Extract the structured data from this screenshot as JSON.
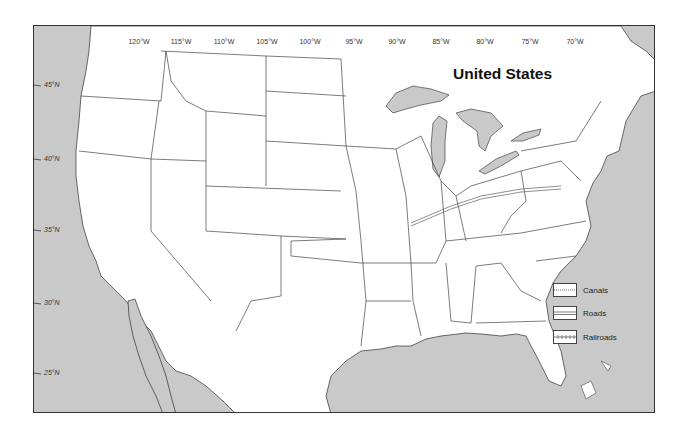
{
  "map": {
    "title": "United States",
    "colors": {
      "water": "#c9c9c9",
      "land": "#ffffff",
      "border": "#444444"
    },
    "longitude_labels": [
      {
        "label": "120°W",
        "x": 139
      },
      {
        "label": "115°W",
        "x": 181
      },
      {
        "label": "110°W",
        "x": 224
      },
      {
        "label": "105°W",
        "x": 267
      },
      {
        "label": "100°W",
        "x": 310
      },
      {
        "label": "95°W",
        "x": 354
      },
      {
        "label": "90°W",
        "x": 397
      },
      {
        "label": "85°W",
        "x": 441
      },
      {
        "label": "80°W",
        "x": 485
      },
      {
        "label": "75°W",
        "x": 530
      },
      {
        "label": "70°W",
        "x": 575
      }
    ],
    "latitude_labels": [
      {
        "label": "45°N",
        "y": 84
      },
      {
        "label": "40°N",
        "y": 158
      },
      {
        "label": "35°N",
        "y": 229
      },
      {
        "label": "30°N",
        "y": 302
      },
      {
        "label": "25°N",
        "y": 372
      }
    ],
    "legend": [
      {
        "label": "Canals",
        "style": "canal"
      },
      {
        "label": "Roads",
        "style": "road"
      },
      {
        "label": "Railroads",
        "style": "railroad"
      }
    ]
  }
}
